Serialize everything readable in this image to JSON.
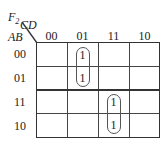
{
  "kmap": {
    "function_name": "F",
    "function_subscript": "2",
    "col_vars": "CD",
    "row_vars": "AB",
    "col_labels": [
      "00",
      "01",
      "11",
      "10"
    ],
    "row_labels": [
      "00",
      "01",
      "11",
      "10"
    ],
    "cells": [
      [
        "",
        "1",
        "",
        ""
      ],
      [
        "",
        "1",
        "",
        ""
      ],
      [
        "",
        "",
        "1",
        ""
      ],
      [
        "",
        "",
        "1",
        ""
      ]
    ],
    "groups": [
      {
        "cells": [
          [
            0,
            1
          ],
          [
            1,
            1
          ]
        ],
        "label": "A'C'D"
      },
      {
        "cells": [
          [
            2,
            2
          ],
          [
            3,
            2
          ]
        ],
        "label": "ACD"
      }
    ]
  }
}
